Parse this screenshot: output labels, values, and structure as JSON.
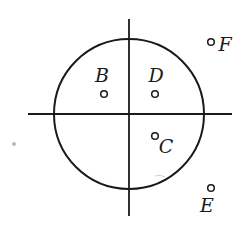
{
  "diagram": {
    "type": "circle-with-axes",
    "colors": {
      "stroke": "#1a1a1a",
      "background": "#ffffff",
      "speck": "#b8b8b8"
    },
    "circle": {
      "cx": 129,
      "cy": 114,
      "r": 75
    },
    "axes": {
      "horizontal": {
        "x1": 28,
        "y1": 114,
        "x2": 232,
        "y2": 114
      },
      "vertical": {
        "x1": 129,
        "y1": 19,
        "x2": 129,
        "y2": 216
      }
    },
    "points": [
      {
        "id": "B",
        "label": "B",
        "cx": 104,
        "cy": 94,
        "lx": 102,
        "ly": 82,
        "location": "inside circle, upper-left quadrant"
      },
      {
        "id": "D",
        "label": "D",
        "cx": 155,
        "cy": 94,
        "lx": 156,
        "ly": 82,
        "location": "inside circle, upper-right quadrant"
      },
      {
        "id": "C",
        "label": "C",
        "cx": 155,
        "cy": 136,
        "lx": 166,
        "ly": 153,
        "location": "inside circle, lower-right quadrant"
      },
      {
        "id": "F",
        "label": "F",
        "cx": 211,
        "cy": 42,
        "lx": 225,
        "ly": 51,
        "location": "outside circle, upper-right"
      },
      {
        "id": "E",
        "label": "E",
        "cx": 211,
        "cy": 188,
        "lx": 207,
        "ly": 212,
        "location": "outside circle, lower-right"
      }
    ]
  }
}
